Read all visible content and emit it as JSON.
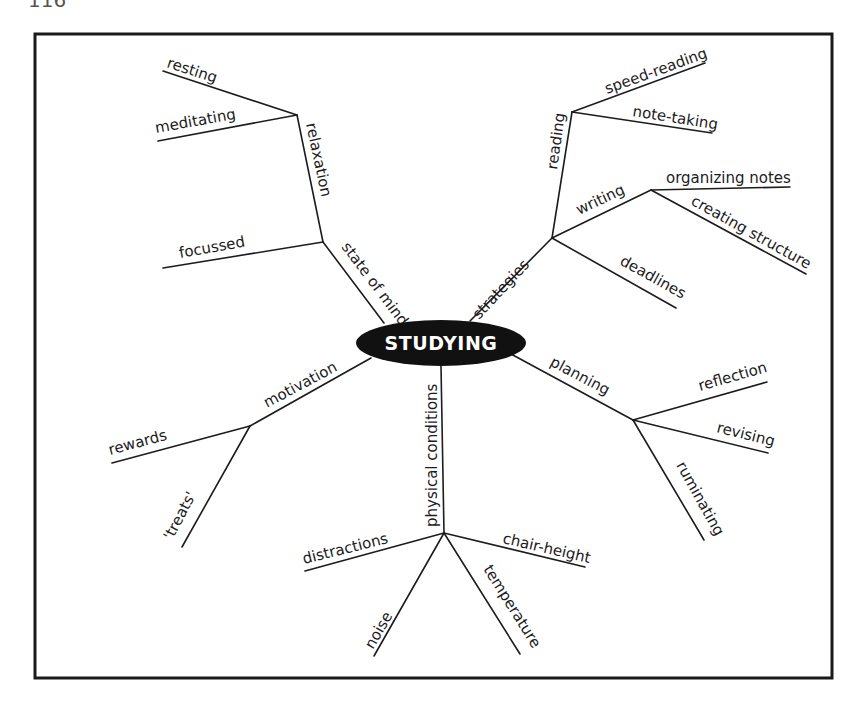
{
  "page": {
    "page_number_fragment": "116"
  },
  "diagram": {
    "type": "mind-map",
    "center": {
      "label": "STUDYING",
      "fill": "#111111",
      "text_color": "#ffffff"
    },
    "branches": [
      {
        "id": "state_of_mind",
        "label": "state of mind",
        "children": [
          {
            "id": "relaxation",
            "label": "relaxation",
            "children": [
              {
                "label": "resting"
              },
              {
                "label": "meditating"
              }
            ]
          },
          {
            "label": "focussed"
          }
        ]
      },
      {
        "id": "strategies",
        "label": "strategies",
        "children": [
          {
            "id": "reading",
            "label": "reading",
            "children": [
              {
                "label": "speed-reading"
              },
              {
                "label": "note-taking"
              }
            ]
          },
          {
            "id": "writing",
            "label": "writing",
            "children": [
              {
                "label": "organizing notes"
              },
              {
                "label": "creating structure"
              }
            ]
          },
          {
            "label": "deadlines"
          }
        ]
      },
      {
        "id": "planning",
        "label": "planning",
        "children": [
          {
            "label": "reflection"
          },
          {
            "label": "revising"
          },
          {
            "label": "ruminating"
          }
        ]
      },
      {
        "id": "physical_conditions",
        "label": "physical conditions",
        "children": [
          {
            "label": "distractions"
          },
          {
            "label": "chair-height"
          },
          {
            "label": "noise"
          },
          {
            "label": "temperature"
          }
        ]
      },
      {
        "id": "motivation",
        "label": "motivation",
        "children": [
          {
            "label": "rewards"
          },
          {
            "label": "'treats'"
          }
        ]
      }
    ]
  },
  "labels": {
    "center": "STUDYING",
    "state_of_mind": "state of mind",
    "relaxation": "relaxation",
    "resting": "resting",
    "meditating": "meditating",
    "focussed": "focussed",
    "strategies": "strategies",
    "reading": "reading",
    "speed_reading": "speed-reading",
    "note_taking": "note-taking",
    "writing": "writing",
    "organizing_notes": "organizing notes",
    "creating_structure": "creating structure",
    "deadlines": "deadlines",
    "planning": "planning",
    "reflection": "reflection",
    "revising": "revising",
    "ruminating": "ruminating",
    "physical_conditions": "physical conditions",
    "distractions": "distractions",
    "chair_height": "chair-height",
    "noise": "noise",
    "temperature": "temperature",
    "motivation": "motivation",
    "rewards": "rewards",
    "treats": "'treats'"
  }
}
